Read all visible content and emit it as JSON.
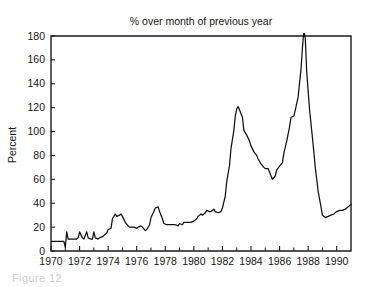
{
  "figure": {
    "title": "% over month of previous year",
    "caption_fragment": "Figure 12"
  },
  "chart_data": {
    "type": "line",
    "title": "% over month of previous year",
    "xlabel": "",
    "ylabel": "Percent",
    "xlim": [
      1970.0,
      1991.0
    ],
    "ylim": [
      0,
      180
    ],
    "grid": false,
    "legend": "none",
    "line_color": "#101010",
    "y_ticks": [
      0,
      20,
      40,
      60,
      80,
      100,
      120,
      140,
      160,
      180
    ],
    "y_tick_labels": [
      "0",
      "20",
      "40",
      "60",
      "80",
      "100",
      "120",
      "140",
      "160",
      "180"
    ],
    "x_ticks": [
      1970,
      1972,
      1974,
      1976,
      1978,
      1980,
      1982,
      1984,
      1986,
      1988,
      1990
    ],
    "x_tick_labels": [
      "1970",
      "1972",
      "1974",
      "1976",
      "1978",
      "1980",
      "1982",
      "1984",
      "1986",
      "1988",
      "1990"
    ],
    "x_minor_ticks": [
      1971,
      1973,
      1975,
      1977,
      1979,
      1981,
      1983,
      1985,
      1987,
      1989
    ],
    "notes": [
      "Peak of about 121 percent near 1983.0",
      "Local trough of about 60 percent near 1985.3",
      "Maximum of about 185 percent near 1987.7, clipped at top of axis",
      "Series ends about 39 percent at 1991.0"
    ],
    "series": [
      {
        "name": "% over month of previous year",
        "x": [
          1970.0,
          1970.1,
          1970.2,
          1970.4,
          1970.5,
          1970.7,
          1970.8,
          1970.9,
          1971.0,
          1971.1,
          1971.2,
          1971.3,
          1971.5,
          1971.6,
          1971.8,
          1971.9,
          1972.0,
          1972.2,
          1972.3,
          1972.5,
          1972.6,
          1972.8,
          1972.9,
          1973.0,
          1973.1,
          1973.3,
          1973.4,
          1973.6,
          1973.7,
          1973.9,
          1974.0,
          1974.2,
          1974.3,
          1974.5,
          1974.6,
          1974.8,
          1974.9,
          1975.0,
          1975.2,
          1975.4,
          1975.5,
          1975.7,
          1975.8,
          1976.0,
          1976.1,
          1976.3,
          1976.4,
          1976.6,
          1976.7,
          1976.9,
          1977.0,
          1977.2,
          1977.3,
          1977.5,
          1977.6,
          1977.8,
          1977.9,
          1978.1,
          1978.2,
          1978.4,
          1978.5,
          1978.7,
          1978.9,
          1979.0,
          1979.2,
          1979.3,
          1979.5,
          1979.7,
          1979.8,
          1980.0,
          1980.2,
          1980.3,
          1980.5,
          1980.6,
          1980.8,
          1980.9,
          1981.1,
          1981.2,
          1981.4,
          1981.5,
          1981.7,
          1981.9,
          1982.0,
          1982.2,
          1982.3,
          1982.5,
          1982.6,
          1982.8,
          1982.9,
          1983.0,
          1983.1,
          1983.2,
          1983.4,
          1983.5,
          1983.7,
          1983.9,
          1984.0,
          1984.2,
          1984.4,
          1984.5,
          1984.7,
          1984.9,
          1985.0,
          1985.2,
          1985.3,
          1985.5,
          1985.7,
          1985.8,
          1986.0,
          1986.2,
          1986.3,
          1986.5,
          1986.7,
          1986.8,
          1987.0,
          1987.1,
          1987.3,
          1987.4,
          1987.5,
          1987.6,
          1987.7,
          1987.8,
          1987.9,
          1988.1,
          1988.3,
          1988.5,
          1988.7,
          1988.9,
          1989.0,
          1989.2,
          1989.4,
          1989.6,
          1989.8,
          1990.0,
          1990.2,
          1990.4,
          1990.6,
          1990.8,
          1991.0
        ],
        "y": [
          8,
          8,
          8,
          8,
          8,
          8,
          8,
          8,
          3,
          16,
          10,
          10,
          10,
          10,
          10,
          11,
          16,
          11,
          10,
          16,
          11,
          10,
          10,
          16,
          11,
          10,
          11,
          12,
          13,
          15,
          18,
          19,
          27,
          31,
          29,
          30,
          31,
          29,
          24,
          21,
          20,
          20,
          20,
          19,
          20,
          21,
          20,
          17,
          18,
          22,
          28,
          33,
          36,
          37,
          33,
          27,
          23,
          22,
          22,
          22,
          22,
          22,
          21,
          23,
          22,
          24,
          24,
          24,
          24,
          25,
          27,
          29,
          31,
          30,
          32,
          34,
          33,
          33,
          35,
          33,
          32,
          33,
          36,
          46,
          58,
          72,
          86,
          101,
          113,
          119,
          121,
          118,
          112,
          101,
          97,
          92,
          88,
          83,
          80,
          77,
          73,
          70,
          69,
          69,
          66,
          60,
          63,
          68,
          71,
          74,
          82,
          92,
          104,
          112,
          113,
          118,
          129,
          141,
          152,
          170,
          185,
          178,
          150,
          118,
          95,
          70,
          50,
          37,
          30,
          28,
          29,
          30,
          31,
          33,
          34,
          34,
          35,
          37,
          39
        ]
      }
    ]
  }
}
